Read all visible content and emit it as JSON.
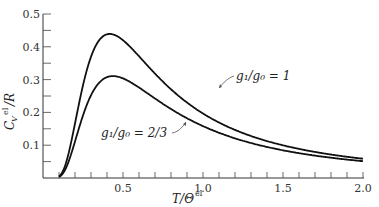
{
  "chart_data": {
    "type": "line",
    "title": "",
    "xlabel": "T/Θ^el",
    "ylabel": "C_V^el/R",
    "xlim": [
      0,
      2.0
    ],
    "ylim": [
      0,
      0.5
    ],
    "grid": false,
    "legend": "inline annotations with arrows",
    "x_ticks": [
      0.5,
      1.0,
      1.5,
      2.0
    ],
    "x_tick_labels": [
      "0.5",
      "1.0",
      "1.5",
      "2.0"
    ],
    "x_minor_step": 0.1,
    "y_ticks": [
      0.1,
      0.2,
      0.3,
      0.4,
      0.5
    ],
    "y_tick_labels": [
      "0.1",
      "0.2",
      "0.3",
      "0.4",
      "0.5"
    ],
    "y_minor_step": 0.05,
    "series": [
      {
        "name": "g1/g0 = 1",
        "ratio": 1,
        "x": [
          0.1,
          0.2,
          0.3,
          0.4,
          0.43,
          0.5,
          0.7,
          1.0,
          1.5,
          2.0
        ],
        "values": [
          0.005,
          0.16,
          0.38,
          0.44,
          0.44,
          0.42,
          0.33,
          0.2,
          0.1,
          0.06
        ]
      },
      {
        "name": "g1/g0 = 2/3",
        "ratio": 0.6667,
        "x": [
          0.1,
          0.2,
          0.3,
          0.4,
          0.45,
          0.5,
          0.7,
          1.0,
          1.5,
          2.0
        ],
        "values": [
          0.003,
          0.12,
          0.27,
          0.31,
          0.31,
          0.3,
          0.25,
          0.17,
          0.08,
          0.05
        ]
      }
    ],
    "annotations": [
      {
        "text": "g₁/g₀ = 1",
        "target_series": 0
      },
      {
        "text": "g₁/g₀ = 2/3",
        "target_series": 1
      }
    ]
  },
  "labels": {
    "x_axis_T": "T/Θ",
    "x_axis_sup": "el",
    "y_axis_C": "C",
    "y_axis_sub": "V",
    "y_axis_sup": "el",
    "y_axis_R": "/R",
    "anno1": "g₁/g₀ = 1",
    "anno2": "g₁/g₀ = 2/3"
  }
}
